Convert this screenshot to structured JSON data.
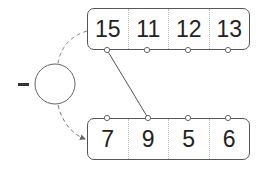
{
  "operation": {
    "symbol": "minus",
    "answer_blank": ""
  },
  "top_row": {
    "values": [
      "15",
      "11",
      "12",
      "13"
    ]
  },
  "bottom_row": {
    "values": [
      "7",
      "9",
      "5",
      "6"
    ]
  },
  "connection": {
    "from_top_index": 0,
    "to_bottom_index": 1
  },
  "colors": {
    "stroke": "#555555",
    "text": "#222222",
    "dash": "#777777"
  }
}
